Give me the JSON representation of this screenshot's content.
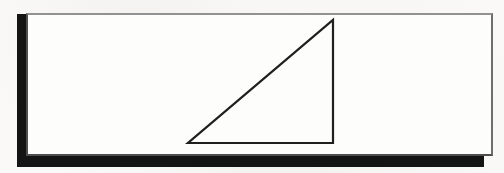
{
  "figure": {
    "background_color": "#faf9f7",
    "panel": {
      "name": "panel",
      "shape": "rectangle",
      "fill": "#fdfdfc",
      "border_color": "#4e4e4e",
      "border_top_color": "#929292",
      "x": 26,
      "y": 13,
      "width": 467,
      "height": 143
    },
    "shadow": {
      "name": "drop-shadow",
      "color": "#141414",
      "x": 17,
      "y": 14,
      "width": 467,
      "height": 153,
      "visible_edges": "left and bottom"
    },
    "triangle": {
      "name": "right-triangle",
      "stroke_color": "#1f1f1f",
      "stroke_width": 2.2,
      "fill": "none",
      "points": "333,20 333,143 188,143",
      "vertices": {
        "apex": [
          333,
          20
        ],
        "bottom_right": [
          333,
          143
        ],
        "bottom_left": [
          188,
          143
        ]
      },
      "right_angle_at": "bottom-right",
      "orientation": "vertical leg on right, horizontal leg on bottom, hypotenuse rising left-to-right"
    }
  }
}
